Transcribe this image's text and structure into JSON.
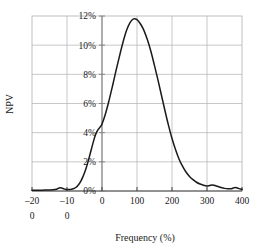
{
  "chart_data": {
    "type": "line",
    "title": "",
    "xlabel": "Frequency (%)",
    "ylabel": "NPV",
    "xlim": [
      -200,
      400
    ],
    "ylim": [
      0,
      12
    ],
    "grid": true,
    "legend": "none",
    "x_ticks": [
      -200,
      -100,
      0,
      100,
      200,
      300,
      400
    ],
    "x_tick_labels": [
      "-200",
      "-100",
      "0",
      "100",
      "200",
      "300",
      "400"
    ],
    "x_tick_labels_line1": [
      "–20",
      "–10",
      "0",
      "100",
      "200",
      "300",
      "400"
    ],
    "x_tick_labels_line2": [
      "0",
      "0",
      "",
      "",
      "",
      "",
      ""
    ],
    "y_ticks": [
      0,
      2,
      4,
      6,
      8,
      10,
      12
    ],
    "y_tick_labels": [
      "0%",
      "2%",
      "4%",
      "6%",
      "8%",
      "10%",
      "12%"
    ],
    "series": [
      {
        "name": "NPV distribution",
        "color": "#1a1a1a",
        "x": [
          -200,
          -190,
          -180,
          -170,
          -160,
          -150,
          -140,
          -130,
          -125,
          -120,
          -115,
          -110,
          -105,
          -100,
          -95,
          -90,
          -85,
          -80,
          -75,
          -70,
          -65,
          -60,
          -55,
          -50,
          -45,
          -40,
          -35,
          -30,
          -25,
          -20,
          -15,
          -10,
          -5,
          0,
          10,
          20,
          30,
          40,
          50,
          60,
          70,
          80,
          90,
          100,
          110,
          120,
          130,
          140,
          150,
          160,
          170,
          180,
          190,
          200,
          210,
          220,
          230,
          240,
          250,
          260,
          270,
          280,
          290,
          300,
          305,
          310,
          315,
          320,
          330,
          340,
          350,
          360,
          370,
          375,
          380,
          385,
          390,
          395,
          400
        ],
        "y": [
          0.06,
          0.06,
          0.06,
          0.06,
          0.07,
          0.07,
          0.08,
          0.12,
          0.18,
          0.22,
          0.2,
          0.16,
          0.12,
          0.1,
          0.1,
          0.11,
          0.13,
          0.17,
          0.24,
          0.35,
          0.5,
          0.7,
          0.95,
          1.25,
          1.6,
          2.0,
          2.45,
          2.9,
          3.35,
          3.75,
          4.05,
          4.25,
          4.4,
          4.6,
          5.3,
          6.2,
          7.2,
          8.25,
          9.25,
          10.2,
          11.0,
          11.55,
          11.8,
          11.75,
          11.45,
          11.0,
          10.35,
          9.55,
          8.6,
          7.6,
          6.55,
          5.5,
          4.5,
          3.6,
          2.85,
          2.2,
          1.7,
          1.3,
          1.0,
          0.78,
          0.6,
          0.48,
          0.4,
          0.35,
          0.36,
          0.4,
          0.42,
          0.4,
          0.32,
          0.24,
          0.18,
          0.15,
          0.16,
          0.2,
          0.24,
          0.22,
          0.18,
          0.14,
          0.12
        ]
      }
    ]
  },
  "axis": {
    "y_label": "NPV",
    "x_label": "Frequency (%)"
  },
  "colors": {
    "curve": "#1a1a1a",
    "grid": "#b0b0b0",
    "axis": "#808080",
    "frame": "#b0b0b0",
    "text": "#1a1a1a"
  }
}
